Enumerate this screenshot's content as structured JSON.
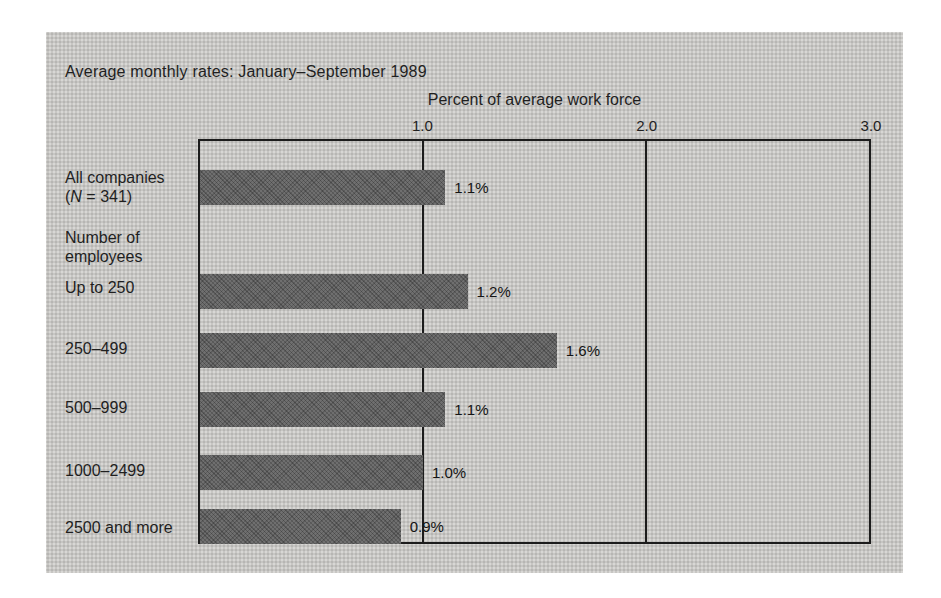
{
  "panel": {
    "background": "#c7c6c3",
    "bar_color": "#6f6f6f",
    "line_color": "#1c1c1c"
  },
  "title": "Average monthly rates: January–September 1989",
  "chart_data": {
    "type": "bar",
    "orientation": "horizontal",
    "axis_title": "Percent of average work force",
    "xlim": [
      0,
      3.0
    ],
    "x_ticks": [
      "1.0",
      "2.0",
      "3.0"
    ],
    "gridlines_at": [
      1.0,
      2.0
    ],
    "grid": "vertical lines at 1.0 and 2.0, frame around plot",
    "section_header": {
      "line1": "Number of",
      "line2": "employees"
    },
    "rows": [
      {
        "label_line1": "All companies",
        "label_line2_prefix": "(",
        "label_line2_italic": "N",
        "label_line2_suffix": " = 341)",
        "value": 1.1,
        "value_label": "1.1%"
      },
      {
        "label": "Up to 250",
        "value": 1.2,
        "value_label": "1.2%"
      },
      {
        "label": "250–499",
        "value": 1.6,
        "value_label": "1.6%"
      },
      {
        "label": "500–999",
        "value": 1.1,
        "value_label": "1.1%"
      },
      {
        "label": "1000–2499",
        "value": 1.0,
        "value_label": "1.0%"
      },
      {
        "label": "2500 and more",
        "value": 0.9,
        "value_label": "0.9%"
      }
    ]
  }
}
